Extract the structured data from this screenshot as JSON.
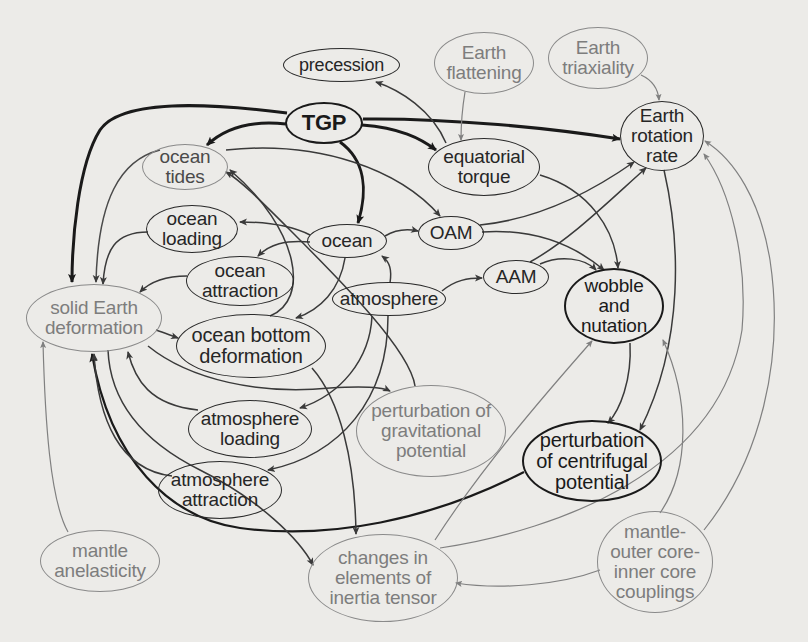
{
  "diagram": {
    "title": "",
    "nodes": [
      {
        "id": "precession",
        "label": "precession",
        "style": "dark",
        "x": 283,
        "y": 48,
        "w": 117,
        "h": 34
      },
      {
        "id": "earth_flattening",
        "label": "Earth\nflattening",
        "style": "grey",
        "x": 434,
        "y": 32,
        "w": 100,
        "h": 62
      },
      {
        "id": "earth_triaxiality",
        "label": "Earth\ntriaxiality",
        "style": "grey",
        "x": 548,
        "y": 27,
        "w": 100,
        "h": 62
      },
      {
        "id": "tgp",
        "label": "TGP",
        "style": "bold",
        "x": 285,
        "y": 102,
        "w": 78,
        "h": 42
      },
      {
        "id": "earth_rotation_rate",
        "label": "Earth\nrotation\nrate",
        "style": "dark",
        "x": 620,
        "y": 101,
        "w": 84,
        "h": 70
      },
      {
        "id": "ocean_tides",
        "label": "ocean\ntides",
        "style": "grey",
        "x": 142,
        "y": 144,
        "w": 86,
        "h": 46
      },
      {
        "id": "equatorial_torque",
        "label": "equatorial\ntorque",
        "style": "dark",
        "x": 428,
        "y": 138,
        "w": 112,
        "h": 58
      },
      {
        "id": "ocean_loading",
        "label": "ocean\nloading",
        "style": "dark",
        "x": 146,
        "y": 205,
        "w": 92,
        "h": 48
      },
      {
        "id": "ocean",
        "label": "ocean",
        "style": "dark",
        "x": 307,
        "y": 224,
        "w": 80,
        "h": 34
      },
      {
        "id": "oam",
        "label": "OAM",
        "style": "dark",
        "x": 418,
        "y": 216,
        "w": 66,
        "h": 34
      },
      {
        "id": "ocean_attraction",
        "label": "ocean\nattraction",
        "style": "dark",
        "x": 186,
        "y": 256,
        "w": 108,
        "h": 50
      },
      {
        "id": "aam",
        "label": "AAM",
        "style": "dark",
        "x": 483,
        "y": 260,
        "w": 66,
        "h": 34
      },
      {
        "id": "atmosphere",
        "label": "atmosphere",
        "style": "dark",
        "x": 332,
        "y": 282,
        "w": 114,
        "h": 34
      },
      {
        "id": "wobble_and_nutation",
        "label": "wobble\nand\nnutation",
        "style": "bold",
        "x": 564,
        "y": 268,
        "w": 100,
        "h": 76
      },
      {
        "id": "solid_earth_deformation",
        "label": "solid Earth\ndeformation",
        "style": "grey",
        "x": 26,
        "y": 284,
        "w": 136,
        "h": 68
      },
      {
        "id": "ocean_bottom_deformation",
        "label": "ocean bottom\ndeformation",
        "style": "dark",
        "x": 176,
        "y": 314,
        "w": 150,
        "h": 64
      },
      {
        "id": "atmosphere_loading",
        "label": "atmosphere\nloading",
        "style": "dark",
        "x": 188,
        "y": 400,
        "w": 124,
        "h": 58
      },
      {
        "id": "perturbation_of_gravitational_potential",
        "label": "perturbation of\ngravitational\npotential",
        "style": "grey",
        "x": 356,
        "y": 385,
        "w": 150,
        "h": 92
      },
      {
        "id": "perturbation_of_centrifugal_potential",
        "label": "perturbation\nof centrifugal\npotential",
        "style": "bold",
        "x": 522,
        "y": 420,
        "w": 140,
        "h": 82
      },
      {
        "id": "atmosphere_attraction",
        "label": "atmosphere\nattraction",
        "style": "dark",
        "x": 158,
        "y": 461,
        "w": 124,
        "h": 58
      },
      {
        "id": "mantle_anelasticity",
        "label": "mantle\nanelasticity",
        "style": "grey",
        "x": 40,
        "y": 530,
        "w": 120,
        "h": 62
      },
      {
        "id": "changes_in_elements_of_inertia_tensor",
        "label": "changes in\nelements of\ninertia tensor",
        "style": "grey",
        "x": 308,
        "y": 534,
        "w": 150,
        "h": 88
      },
      {
        "id": "mantle_outer_core_inner_core_couplings",
        "label": "mantle-\nouter core-\ninner core\ncouplings",
        "style": "grey",
        "x": 597,
        "y": 511,
        "w": 116,
        "h": 102
      }
    ],
    "edges": [
      {
        "from": "tgp",
        "to": "solid_earth_deformation",
        "weight": "bold"
      },
      {
        "from": "tgp",
        "to": "ocean_tides",
        "weight": "bold"
      },
      {
        "from": "tgp",
        "to": "ocean",
        "weight": "bold"
      },
      {
        "from": "tgp",
        "to": "equatorial_torque",
        "weight": "bold"
      },
      {
        "from": "tgp",
        "to": "earth_rotation_rate",
        "weight": "bold"
      },
      {
        "from": "equatorial_torque",
        "to": "precession",
        "weight": "normal"
      },
      {
        "from": "equatorial_torque",
        "to": "wobble_and_nutation",
        "weight": "normal"
      },
      {
        "from": "earth_flattening",
        "to": "equatorial_torque",
        "weight": "thin"
      },
      {
        "from": "earth_triaxiality",
        "to": "earth_rotation_rate",
        "weight": "thin"
      },
      {
        "from": "ocean_tides",
        "to": "solid_earth_deformation",
        "weight": "thin"
      },
      {
        "from": "ocean_tides",
        "to": "oam",
        "weight": "normal"
      },
      {
        "from": "ocean",
        "to": "ocean_loading",
        "weight": "normal"
      },
      {
        "from": "ocean",
        "to": "ocean_attraction",
        "weight": "normal"
      },
      {
        "from": "ocean",
        "to": "oam",
        "weight": "normal"
      },
      {
        "from": "ocean",
        "to": "ocean_bottom_deformation",
        "weight": "normal"
      },
      {
        "from": "ocean_loading",
        "to": "solid_earth_deformation",
        "weight": "normal"
      },
      {
        "from": "ocean_attraction",
        "to": "solid_earth_deformation",
        "weight": "normal"
      },
      {
        "from": "oam",
        "to": "earth_rotation_rate",
        "weight": "normal"
      },
      {
        "from": "oam",
        "to": "wobble_and_nutation",
        "weight": "normal"
      },
      {
        "from": "atmosphere",
        "to": "ocean",
        "weight": "normal"
      },
      {
        "from": "atmosphere",
        "to": "aam",
        "weight": "normal"
      },
      {
        "from": "atmosphere",
        "to": "atmosphere_loading",
        "weight": "normal"
      },
      {
        "from": "atmosphere",
        "to": "atmosphere_attraction",
        "weight": "normal"
      },
      {
        "from": "aam",
        "to": "earth_rotation_rate",
        "weight": "normal"
      },
      {
        "from": "aam",
        "to": "wobble_and_nutation",
        "weight": "normal"
      },
      {
        "from": "solid_earth_deformation",
        "to": "ocean_bottom_deformation",
        "weight": "normal"
      },
      {
        "from": "solid_earth_deformation",
        "to": "perturbation_of_gravitational_potential",
        "weight": "normal"
      },
      {
        "from": "solid_earth_deformation",
        "to": "changes_in_elements_of_inertia_tensor",
        "weight": "normal"
      },
      {
        "from": "ocean_bottom_deformation",
        "to": "ocean_tides",
        "weight": "normal"
      },
      {
        "from": "ocean_bottom_deformation",
        "to": "changes_in_elements_of_inertia_tensor",
        "weight": "normal"
      },
      {
        "from": "atmosphere_loading",
        "to": "solid_earth_deformation",
        "weight": "normal"
      },
      {
        "from": "atmosphere_attraction",
        "to": "solid_earth_deformation",
        "weight": "normal"
      },
      {
        "from": "perturbation_of_gravitational_potential",
        "to": "ocean_tides",
        "weight": "normal"
      },
      {
        "from": "perturbation_of_centrifugal_potential",
        "to": "solid_earth_deformation",
        "weight": "bold"
      },
      {
        "from": "wobble_and_nutation",
        "to": "perturbation_of_centrifugal_potential",
        "weight": "normal"
      },
      {
        "from": "earth_rotation_rate",
        "to": "perturbation_of_centrifugal_potential",
        "weight": "normal"
      },
      {
        "from": "mantle_anelasticity",
        "to": "solid_earth_deformation",
        "weight": "thin"
      },
      {
        "from": "changes_in_elements_of_inertia_tensor",
        "to": "wobble_and_nutation",
        "weight": "thin"
      },
      {
        "from": "changes_in_elements_of_inertia_tensor",
        "to": "earth_rotation_rate",
        "weight": "thin"
      },
      {
        "from": "mantle_outer_core_inner_core_couplings",
        "to": "changes_in_elements_of_inertia_tensor",
        "weight": "thin"
      },
      {
        "from": "mantle_outer_core_inner_core_couplings",
        "to": "wobble_and_nutation",
        "weight": "thin"
      },
      {
        "from": "mantle_outer_core_inner_core_couplings",
        "to": "earth_rotation_rate",
        "weight": "thin"
      }
    ]
  },
  "colors": {
    "paper": "#ecebe8",
    "ink_dark": "#1a1a1a",
    "ink_normal": "#3a3a3a",
    "ink_grey": "#808080"
  }
}
